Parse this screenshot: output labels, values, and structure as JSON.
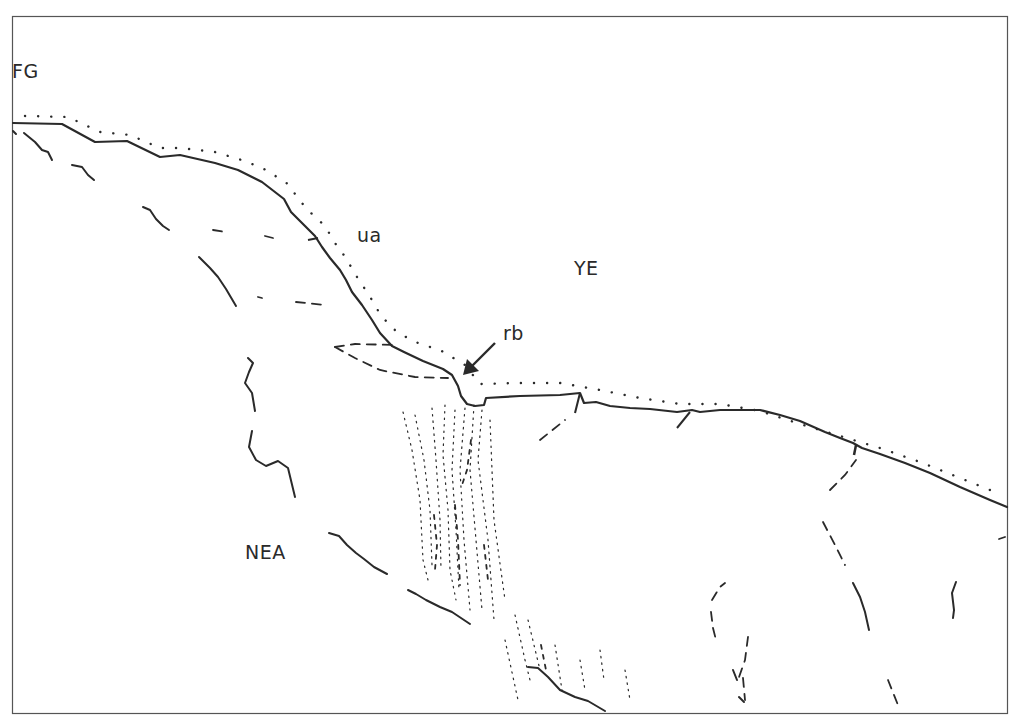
{
  "figure": {
    "type": "geological line sketch",
    "frame": {
      "x": 12,
      "y": 16,
      "width": 995,
      "height": 697,
      "stroke": "#555555"
    },
    "colors": {
      "line": "#2a2a2a",
      "background": "#ffffff"
    }
  },
  "labels": {
    "fg": {
      "text": "FG",
      "x": 12,
      "y": 60
    },
    "ua": {
      "text": "ua",
      "x": 357,
      "y": 224
    },
    "ye": {
      "text": "YE",
      "x": 574,
      "y": 257
    },
    "rb": {
      "text": "rb",
      "x": 503,
      "y": 322
    },
    "nea": {
      "text": "NEA",
      "x": 245,
      "y": 541
    }
  },
  "legend_hint": {
    "solid_line": "boundary",
    "dotted_line": "upper unit margin",
    "dashed_lines": "fractures / lineaments",
    "arrow": "points to rb"
  }
}
